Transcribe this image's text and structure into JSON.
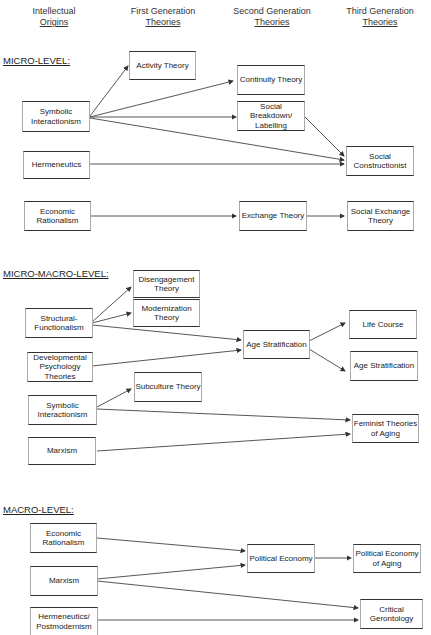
{
  "headers": {
    "col1": {
      "line1": "Intellectual",
      "line2": "Origins"
    },
    "col2": {
      "line1": "First Generation",
      "line2": "Theories"
    },
    "col3": {
      "line1": "Second Generation",
      "line2": "Theories"
    },
    "col4": {
      "line1": "Third Generation",
      "line2": "Theories"
    }
  },
  "sections": {
    "micro": {
      "label": "MICRO-LEVEL:",
      "origins": [
        "Symbolic Interactionism",
        "Hermeneutics",
        "Economic Rationalism"
      ],
      "first_gen": [
        "Activity Theory"
      ],
      "second_gen": [
        "Continuity Theory",
        "Social Breakdown/ Labelling",
        "Exchange Theory"
      ],
      "third_gen": [
        "Social Constructionist",
        "Social Exchange Theory"
      ]
    },
    "micro_macro": {
      "label": "MICRO-MACRO-LEVEL:",
      "origins": [
        "Structural-Functionalism",
        "Developmental Psychology Theories",
        "Symbolic Interactionism",
        "Marxism"
      ],
      "first_gen": [
        "Disengagement Theory",
        "Modernization Theory",
        "Subculture Theory"
      ],
      "second_gen": [
        "Age Stratification"
      ],
      "third_gen": [
        "Life Course",
        "Age Stratification",
        "Feminist Theories of Aging"
      ]
    },
    "macro": {
      "label": "MACRO-LEVEL:",
      "origins": [
        "Economic Rationalism",
        "Marxism",
        "Hermeneutics/ Postmodernism"
      ],
      "second_gen": [
        "Political Economy"
      ],
      "third_gen": [
        "Political Economy of Aging",
        "Critical Gerontology"
      ]
    }
  }
}
